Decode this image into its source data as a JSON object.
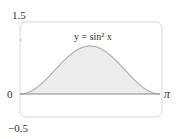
{
  "chart_data": {
    "type": "area",
    "title": "",
    "annotation": "y = sin² x",
    "function": "sin^2(x)",
    "x": [
      0,
      0.3927,
      0.7854,
      1.1781,
      1.5708,
      1.9635,
      2.3562,
      2.7489,
      3.1416
    ],
    "values": [
      0,
      0.1464,
      0.5,
      0.8536,
      1,
      0.8536,
      0.5,
      0.1464,
      0
    ],
    "xlabel": "",
    "ylabel": "",
    "xlim": [
      0,
      3.1416
    ],
    "ylim": [
      -0.5,
      1.5
    ],
    "x_tick_labels": [
      "π"
    ],
    "y_tick_labels": [
      "1.5",
      "0",
      "−0.5"
    ],
    "grid": false,
    "legend": false
  },
  "labels": {
    "y_top": "1.5",
    "y_zero": "0",
    "y_bottom": "−0.5",
    "x_end": "π",
    "curve": "y = sin² x"
  },
  "colors": {
    "curve": "#b5b5b5",
    "fill": "#ececec",
    "axis": "#888888",
    "frame": "#d6d6d6"
  }
}
